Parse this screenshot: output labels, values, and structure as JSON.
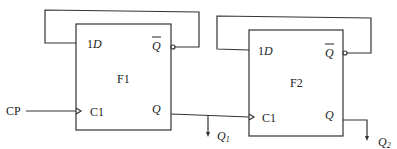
{
  "diagram": {
    "type": "sequential-circuit",
    "input": {
      "label": "CP"
    },
    "flipflops": [
      {
        "name": "F1",
        "inputs": {
          "d": "1D",
          "clk": "C1"
        },
        "outputs": {
          "qbar": "Q",
          "q": "Q"
        },
        "feedback": "Q-bar to 1D",
        "output_label": "Q",
        "output_sub": "1"
      },
      {
        "name": "F2",
        "inputs": {
          "d": "1D",
          "clk": "C1"
        },
        "outputs": {
          "qbar": "Q",
          "q": "Q"
        },
        "feedback": "Q-bar to 1D",
        "output_label": "Q",
        "output_sub": "2"
      }
    ],
    "connections": [
      "CP -> F1.C1",
      "F1.Q -> F2.C1",
      "F1.Q -> Q1 output",
      "F2.Q -> Q2 output"
    ]
  }
}
